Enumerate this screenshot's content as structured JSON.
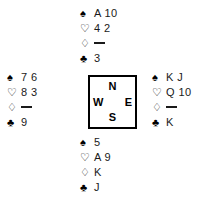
{
  "diagram": {
    "type": "bridge-hand-deal",
    "suit_symbols": {
      "spade": "♠",
      "heart": "♡",
      "diamond": "♢",
      "club": "♣"
    },
    "void_marker": "—"
  },
  "compass": {
    "north": "N",
    "south": "S",
    "west": "W",
    "east": "E"
  },
  "hands": {
    "north": {
      "label": "North",
      "spades": "A 10",
      "hearts": "4 2",
      "diamonds": "",
      "clubs": "3"
    },
    "west": {
      "label": "West",
      "spades": "7 6",
      "hearts": "8 3",
      "diamonds": "",
      "clubs": "9"
    },
    "east": {
      "label": "East",
      "spades": "K J",
      "hearts": "Q 10",
      "diamonds": "",
      "clubs": "K"
    },
    "south": {
      "label": "South",
      "spades": "5",
      "hearts": "A 9",
      "diamonds": "K",
      "clubs": "J"
    }
  },
  "colors": {
    "background": "#ffffff",
    "ink": "#1a1a1a",
    "border": "#000000"
  }
}
